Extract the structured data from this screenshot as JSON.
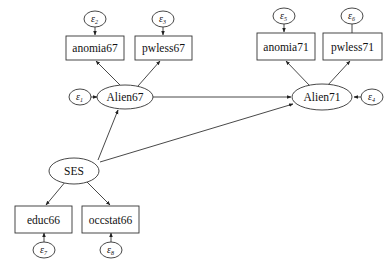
{
  "diagram": {
    "type": "structural-equation-model",
    "latent_variables": [
      {
        "id": "alien67",
        "label": "Alien67"
      },
      {
        "id": "alien71",
        "label": "Alien71"
      },
      {
        "id": "ses",
        "label": "SES"
      }
    ],
    "observed_variables": [
      {
        "id": "anomia67",
        "label": "anomia67"
      },
      {
        "id": "pwless67",
        "label": "pwless67"
      },
      {
        "id": "anomia71",
        "label": "anomia71"
      },
      {
        "id": "pwless71",
        "label": "pwless71"
      },
      {
        "id": "educ66",
        "label": "educ66"
      },
      {
        "id": "occstat66",
        "label": "occstat66"
      }
    ],
    "error_terms": [
      {
        "id": "e1",
        "symbol": "ε",
        "sub": "1",
        "target": "Alien67"
      },
      {
        "id": "e2",
        "symbol": "ε",
        "sub": "2",
        "target": "anomia67"
      },
      {
        "id": "e3",
        "symbol": "ε",
        "sub": "3",
        "target": "pwless67"
      },
      {
        "id": "e4",
        "symbol": "ε",
        "sub": "4",
        "target": "Alien71"
      },
      {
        "id": "e5",
        "symbol": "ε",
        "sub": "5",
        "target": "anomia71"
      },
      {
        "id": "e6",
        "symbol": "ε",
        "sub": "6",
        "target": "pwless71"
      },
      {
        "id": "e7",
        "symbol": "ε",
        "sub": "7",
        "target": "educ66"
      },
      {
        "id": "e8",
        "symbol": "ε",
        "sub": "8",
        "target": "occstat66"
      }
    ],
    "paths": [
      {
        "from": "Alien67",
        "to": "anomia67"
      },
      {
        "from": "Alien67",
        "to": "pwless67"
      },
      {
        "from": "Alien71",
        "to": "anomia71"
      },
      {
        "from": "Alien71",
        "to": "pwless71"
      },
      {
        "from": "SES",
        "to": "educ66"
      },
      {
        "from": "SES",
        "to": "occstat66"
      },
      {
        "from": "SES",
        "to": "Alien67"
      },
      {
        "from": "SES",
        "to": "Alien71"
      },
      {
        "from": "Alien67",
        "to": "Alien71"
      }
    ]
  }
}
